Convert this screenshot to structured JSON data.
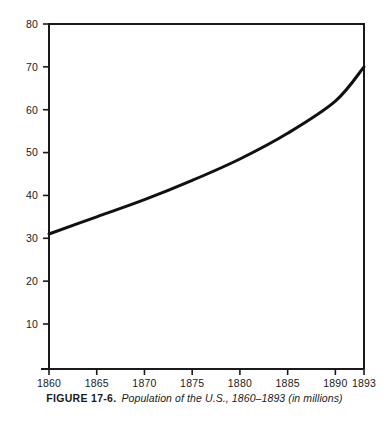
{
  "figure": {
    "caption_number": "FIGURE 17-6.",
    "caption_text": "Population of the U.S., 1860–1893 (in millions)"
  },
  "colors": {
    "axis": "#1a1a1a",
    "curve": "#111111",
    "background": "#ffffff",
    "text": "#1a1a1a"
  },
  "chart_data": {
    "type": "line",
    "title": "Population of the U.S., 1860–1893 (in millions)",
    "xlabel": "",
    "ylabel": "",
    "xlim": [
      1860,
      1893
    ],
    "ylim": [
      0,
      80
    ],
    "grid": false,
    "legend": false,
    "xticks": [
      1860,
      1865,
      1870,
      1875,
      1880,
      1885,
      1890,
      1893
    ],
    "xtick_labels": [
      "1860",
      "1865",
      "1870",
      "1875",
      "1880",
      "1885",
      "1890",
      "1893"
    ],
    "yticks": [
      10,
      20,
      30,
      40,
      50,
      60,
      70,
      80
    ],
    "ytick_labels": [
      "10",
      "20",
      "30",
      "40",
      "50",
      "60",
      "70",
      "80"
    ],
    "series": [
      {
        "name": "Population (millions)",
        "x": [
          1860,
          1865,
          1870,
          1875,
          1880,
          1885,
          1890,
          1893
        ],
        "values": [
          31.0,
          35.0,
          39.0,
          43.5,
          48.5,
          54.5,
          62.0,
          70.0
        ]
      }
    ]
  }
}
